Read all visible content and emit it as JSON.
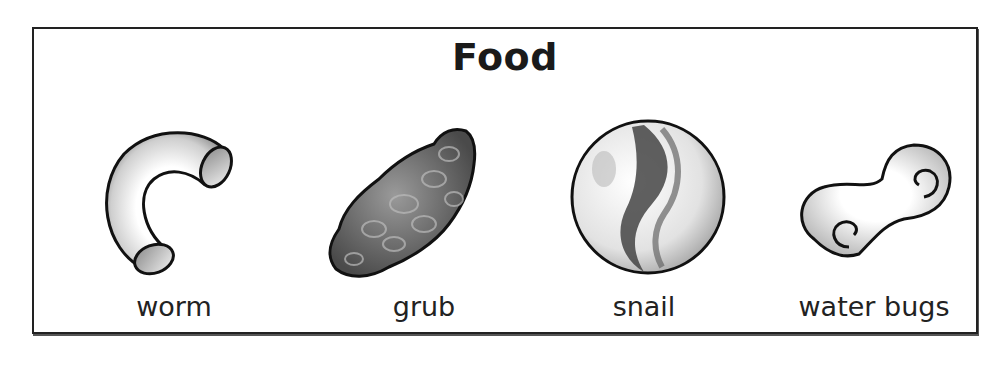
{
  "title": "Food",
  "items": [
    {
      "label": "worm",
      "icon": "macaroni-tube-icon"
    },
    {
      "label": "grub",
      "icon": "lumpy-rock-icon"
    },
    {
      "label": "snail",
      "icon": "marble-icon"
    },
    {
      "label": "water bugs",
      "icon": "swirl-pasta-icon"
    }
  ]
}
